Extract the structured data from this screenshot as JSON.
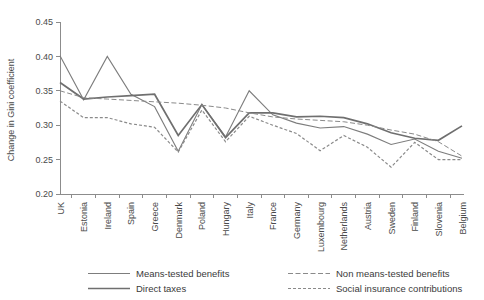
{
  "chart_data": {
    "type": "line",
    "title": "",
    "xlabel": "",
    "ylabel": "Change in Gini coefficient",
    "ylim": [
      0.2,
      0.45
    ],
    "ytick_labels": [
      "0.45",
      "0.40",
      "0.35",
      "0.30",
      "0.25",
      "0.20"
    ],
    "ytick_values": [
      0.45,
      0.4,
      0.35,
      0.3,
      0.25,
      0.2
    ],
    "grid": false,
    "legend_position": "bottom",
    "categories": [
      "UK",
      "Estonia",
      "Ireland",
      "Spain",
      "Greece",
      "Denmark",
      "Poland",
      "Hungary",
      "Italy",
      "France",
      "Germany",
      "Luxembourg",
      "Netherlands",
      "Austria",
      "Sweden",
      "Finland",
      "Slovenia",
      "Belgium"
    ],
    "series": [
      {
        "name": "Means-tested benefits",
        "style": "solid",
        "color": "#7d7d7d",
        "width": 1.1,
        "values": [
          0.401,
          0.337,
          0.4,
          0.345,
          0.327,
          0.262,
          0.33,
          0.283,
          0.35,
          0.315,
          0.303,
          0.296,
          0.298,
          0.287,
          0.272,
          0.28,
          0.262,
          0.252
        ]
      },
      {
        "name": "Direct taxes",
        "style": "solid",
        "color": "#6f6f6f",
        "width": 1.7,
        "values": [
          0.362,
          0.338,
          0.341,
          0.343,
          0.345,
          0.285,
          0.33,
          0.282,
          0.318,
          0.318,
          0.312,
          0.313,
          0.311,
          0.302,
          0.289,
          0.281,
          0.278,
          0.299
        ]
      },
      {
        "name": "Non means-tested benefits",
        "style": "dashed-long",
        "color": "#8a8a8a",
        "width": 1.0,
        "values": [
          0.35,
          0.34,
          0.338,
          0.336,
          0.334,
          0.332,
          0.329,
          0.325,
          0.318,
          0.312,
          0.309,
          0.307,
          0.305,
          0.3,
          0.293,
          0.287,
          0.276,
          0.255
        ]
      },
      {
        "name": "Social insurance contributions",
        "style": "dashed-short",
        "color": "#8a8a8a",
        "width": 1.2,
        "values": [
          0.335,
          0.311,
          0.311,
          0.302,
          0.297,
          0.261,
          0.322,
          0.276,
          0.313,
          0.3,
          0.288,
          0.263,
          0.285,
          0.268,
          0.239,
          0.275,
          0.25,
          0.25
        ]
      }
    ]
  },
  "legend": {
    "items": [
      {
        "label": "Means-tested benefits"
      },
      {
        "label": "Non means-tested benefits"
      },
      {
        "label": "Direct taxes"
      },
      {
        "label": "Social insurance contributions"
      }
    ]
  }
}
